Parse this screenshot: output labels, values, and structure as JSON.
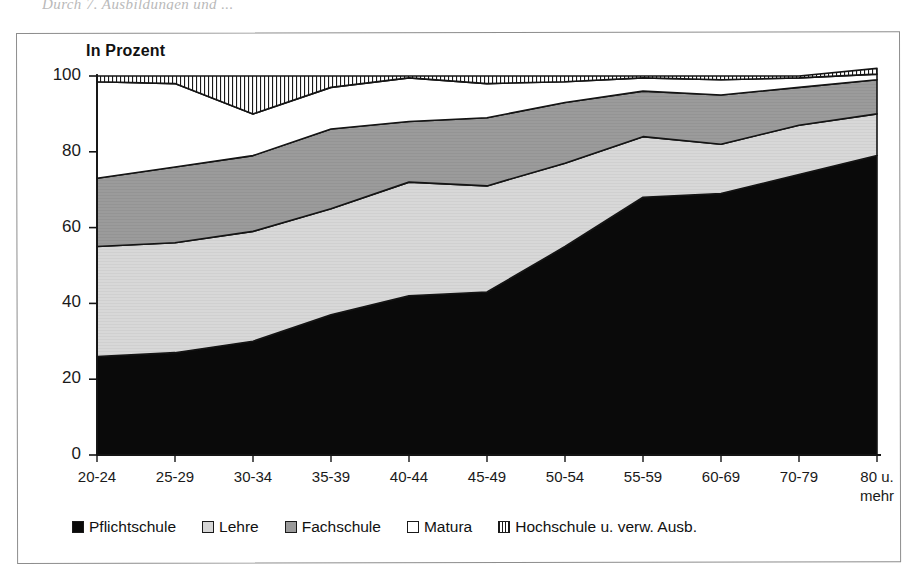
{
  "page": {
    "cut_header_text": "Durch 7. Ausbildungen und ..."
  },
  "chart_title": "In Prozent",
  "legend": {
    "position": "bottom",
    "items": [
      {
        "label": "Pflichtschule",
        "swatch": "sw-black",
        "color": "#0a0a0a"
      },
      {
        "label": "Lehre",
        "swatch": "sw-lightgray",
        "color": "#d6d6d6"
      },
      {
        "label": "Fachschule",
        "swatch": "sw-darkgray",
        "color": "#9a9a9a"
      },
      {
        "label": "Matura",
        "swatch": "sw-white",
        "color": "#ffffff"
      },
      {
        "label": "Hochschule u. verw. Ausb.",
        "swatch": "sw-hatch",
        "color": "#ffffff"
      }
    ]
  },
  "axes": {
    "y_ticks": [
      "0",
      "20",
      "40",
      "60",
      "80",
      "100"
    ],
    "x_ticks": [
      {
        "line1": "20-24",
        "line2": ""
      },
      {
        "line1": "25-29",
        "line2": ""
      },
      {
        "line1": "30-34",
        "line2": ""
      },
      {
        "line1": "35-39",
        "line2": ""
      },
      {
        "line1": "40-44",
        "line2": ""
      },
      {
        "line1": "45-49",
        "line2": ""
      },
      {
        "line1": "50-54",
        "line2": ""
      },
      {
        "line1": "55-59",
        "line2": ""
      },
      {
        "line1": "60-69",
        "line2": ""
      },
      {
        "line1": "70-79",
        "line2": ""
      },
      {
        "line1": "80 u.",
        "line2": "mehr"
      }
    ]
  },
  "chart_data": {
    "type": "area",
    "stacked": true,
    "title": "In Prozent",
    "xlabel": "",
    "ylabel": "In Prozent",
    "ylim": [
      0,
      100
    ],
    "grid": false,
    "legend_position": "bottom",
    "categories": [
      "20-24",
      "25-29",
      "30-34",
      "35-39",
      "40-44",
      "45-49",
      "50-54",
      "55-59",
      "60-69",
      "70-79",
      "80 u. mehr"
    ],
    "series": [
      {
        "name": "Pflichtschule",
        "color": "#0a0a0a",
        "values": [
          26,
          27,
          30,
          37,
          42,
          43,
          55,
          68,
          69,
          74,
          79
        ]
      },
      {
        "name": "Lehre",
        "color": "#d6d6d6",
        "values": [
          29,
          29,
          29,
          28,
          30,
          28,
          22,
          16,
          13,
          13,
          11
        ]
      },
      {
        "name": "Fachschule",
        "color": "#9a9a9a",
        "values": [
          18,
          20,
          20,
          21,
          16,
          18,
          16,
          12,
          13,
          10,
          9
        ]
      },
      {
        "name": "Matura",
        "color": "#ffffff",
        "values": [
          25.5,
          22,
          11,
          11,
          11.5,
          9,
          5.5,
          3.5,
          4,
          2.5,
          1.5
        ]
      },
      {
        "name": "Hochschule u. verw. Ausb.",
        "color": "#ffffff",
        "hatch": "vertical",
        "values": [
          1.5,
          2,
          10,
          3,
          0.5,
          2,
          1.5,
          0.5,
          1,
          0.5,
          0.5
        ]
      }
    ],
    "cumulative_tops": {
      "Pflichtschule": [
        26,
        27,
        30,
        37,
        42,
        43,
        55,
        68,
        69,
        74,
        79
      ],
      "Lehre": [
        55,
        56,
        59,
        65,
        72,
        71,
        77,
        84,
        82,
        87,
        90
      ],
      "Fachschule": [
        73,
        76,
        79,
        86,
        88,
        89,
        93,
        96,
        95,
        97,
        99
      ],
      "Matura": [
        98.5,
        98,
        90,
        97,
        99.5,
        98,
        98.5,
        99.5,
        99,
        99.5,
        100.5
      ],
      "Hochschule u. verw. Ausb.": [
        100,
        100,
        100,
        100,
        100,
        100,
        100,
        100,
        100,
        100,
        102
      ]
    }
  }
}
